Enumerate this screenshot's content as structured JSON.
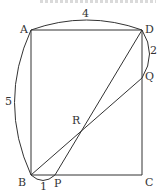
{
  "figure": {
    "type": "rectangle-geometry",
    "rectangle": "ABCD",
    "colors": {
      "stroke": "#333333",
      "text": "#333333",
      "background": "#ffffff"
    },
    "points": {
      "A": {
        "label": "A",
        "x": 31,
        "y": 30
      },
      "B": {
        "label": "B",
        "x": 31,
        "y": 175
      },
      "C": {
        "label": "C",
        "x": 142,
        "y": 175
      },
      "D": {
        "label": "D",
        "x": 142,
        "y": 30
      },
      "P": {
        "label": "P",
        "x": 55,
        "y": 175
      },
      "Q": {
        "label": "Q",
        "x": 142,
        "y": 78
      },
      "R": {
        "label": "R",
        "x": 84,
        "y": 127
      }
    },
    "segments": [
      {
        "from": "A",
        "to": "D"
      },
      {
        "from": "D",
        "to": "C"
      },
      {
        "from": "C",
        "to": "B"
      },
      {
        "from": "B",
        "to": "A"
      },
      {
        "from": "P",
        "to": "D"
      },
      {
        "from": "B",
        "to": "Q"
      }
    ],
    "measures": {
      "AD": "4",
      "AB": "5",
      "DQ": "2",
      "BP": "1"
    }
  }
}
